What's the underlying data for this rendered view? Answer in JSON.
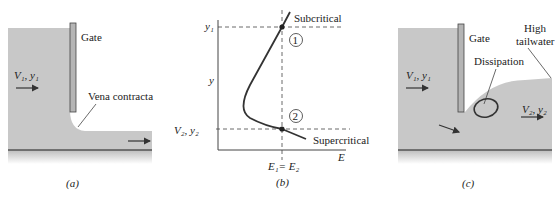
{
  "panel_a": {
    "gate_label": "Gate",
    "upstream_label": "V₁, y₁",
    "vena_label": "Vena contracta",
    "downstream_label": "V₂, y₂",
    "caption": "(a)"
  },
  "panel_b": {
    "y1_label": "y₁",
    "y_axis_label": "y",
    "y2_label": "V₂, y₂",
    "subcritical_label": "Subcritical",
    "supercritical_label": "Supercritical",
    "point1_label": "1",
    "point2_label": "2",
    "x_axis_label": "E",
    "energy_label": "E₁= E₂",
    "caption": "(b)"
  },
  "panel_c": {
    "gate_label": "Gate",
    "tailwater_label_line1": "High",
    "tailwater_label_line2": "tailwater",
    "dissipation_label": "Dissipation",
    "upstream_label": "V₁, y₁",
    "downstream_label": "V₂, y₂",
    "caption": "(c)"
  },
  "colors": {
    "water": "#c8c8c8",
    "ink": "#333333",
    "bed": "#555555"
  }
}
